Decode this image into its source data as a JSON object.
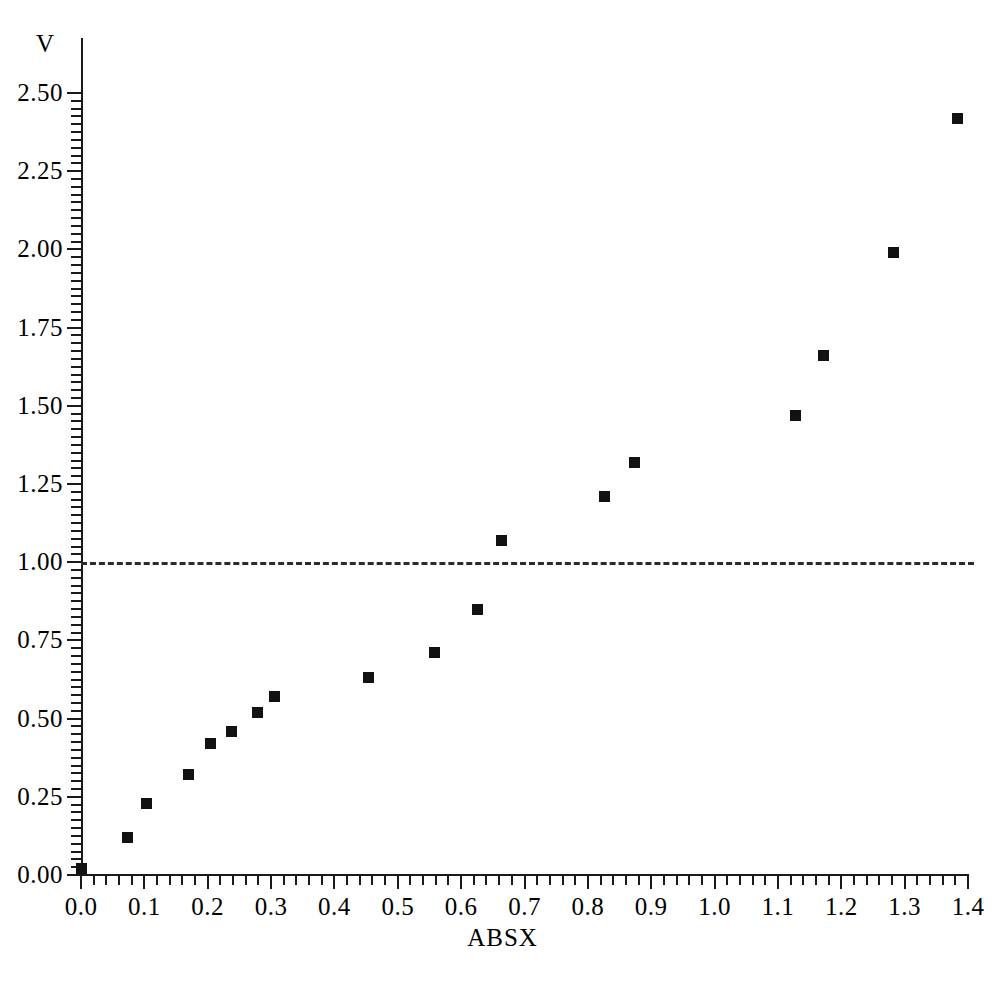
{
  "chart_data": {
    "type": "scatter",
    "title": "",
    "xlabel": "ABSX",
    "ylabel": "V",
    "xlim": [
      0.0,
      1.4
    ],
    "ylim": [
      0.0,
      2.5
    ],
    "grid": false,
    "legend": null,
    "x_ticks": [
      "0.0",
      "0.1",
      "0.2",
      "0.3",
      "0.4",
      "0.5",
      "0.6",
      "0.7",
      "0.8",
      "0.9",
      "1.0",
      "1.1",
      "1.2",
      "1.3",
      "1.4"
    ],
    "x_tick_values": [
      0.0,
      0.1,
      0.2,
      0.3,
      0.4,
      0.5,
      0.6,
      0.7,
      0.8,
      0.9,
      1.0,
      1.1,
      1.2,
      1.3,
      1.4
    ],
    "y_ticks": [
      "0.00",
      "0.25",
      "0.50",
      "0.75",
      "1.00",
      "1.25",
      "1.50",
      "1.75",
      "2.00",
      "2.25",
      "2.50"
    ],
    "y_tick_values": [
      0.0,
      0.25,
      0.5,
      0.75,
      1.0,
      1.25,
      1.5,
      1.75,
      2.0,
      2.25,
      2.5
    ],
    "x_minor_step": 0.02,
    "y_minor_step": 0.025,
    "marker": "square",
    "marker_color": "#121212",
    "marker_size_px": 11,
    "x": [
      0.0,
      0.074,
      0.103,
      0.17,
      0.205,
      0.238,
      0.278,
      0.306,
      0.453,
      0.558,
      0.626,
      0.663,
      0.827,
      0.874,
      1.128,
      1.172,
      1.283,
      1.383
    ],
    "y": [
      0.02,
      0.12,
      0.23,
      0.32,
      0.42,
      0.46,
      0.52,
      0.57,
      0.63,
      0.71,
      0.85,
      1.07,
      1.21,
      1.32,
      1.47,
      1.66,
      1.99,
      2.42
    ],
    "annotations": [
      {
        "name": "reference-line",
        "kind": "hline",
        "y": 1.0,
        "style": "dashed",
        "color": "#2b2b2b",
        "x_start": 0.0,
        "x_end": 1.41
      }
    ]
  }
}
